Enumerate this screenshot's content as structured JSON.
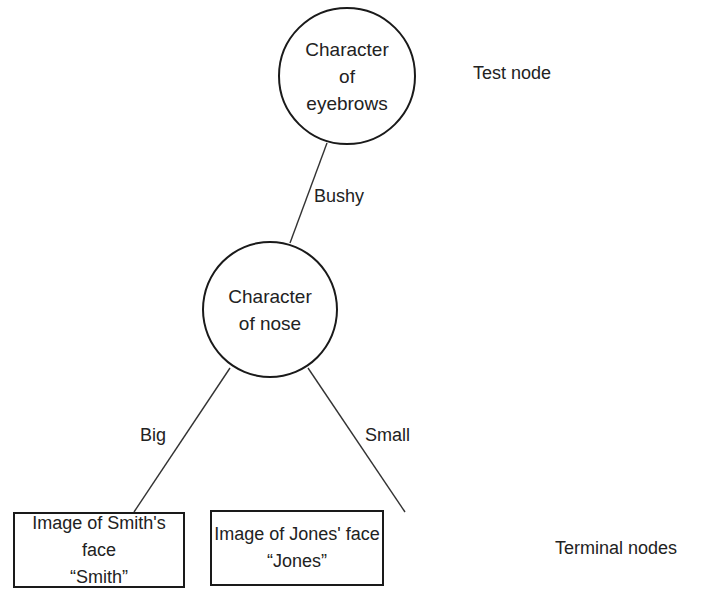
{
  "diagram": {
    "type": "decision-tree",
    "nodes": {
      "eyebrows": {
        "label": "Character\nof\neyebrows",
        "shape": "circle"
      },
      "nose": {
        "label": "Character\nof nose",
        "shape": "circle"
      },
      "smith": {
        "line1": "Image of Smith's face",
        "line2": "“Smith”",
        "shape": "rectangle"
      },
      "jones": {
        "line1": "Image of Jones' face",
        "line2": "“Jones”",
        "shape": "rectangle"
      }
    },
    "edges": {
      "bushy": {
        "label": "Bushy",
        "from": "eyebrows",
        "to": "nose"
      },
      "big": {
        "label": "Big",
        "from": "nose",
        "to": "smith"
      },
      "small": {
        "label": "Small",
        "from": "nose",
        "to": "jones"
      }
    },
    "annotations": {
      "test_node": "Test node",
      "terminal_nodes": "Terminal nodes"
    },
    "colors": {
      "stroke": "#1a1a1a",
      "text": "#222222",
      "background": "#ffffff"
    }
  }
}
